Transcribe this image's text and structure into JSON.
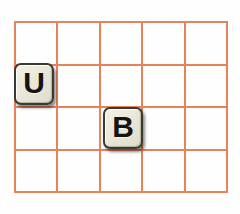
{
  "board": {
    "name": "letter-tile-grid",
    "columns": 5,
    "rows": 4,
    "cell_width": 43,
    "cell_height": 43,
    "grid_line_color": "#e8825a",
    "background_color": "#ffffff"
  },
  "tiles": [
    {
      "letter": "U",
      "row": 2,
      "column": 1,
      "face_color": "#e9e8d9",
      "border_color": "#3a3a34",
      "text_color": "#16140f"
    },
    {
      "letter": "B",
      "row": 3,
      "column": 3,
      "face_color": "#e9e8d9",
      "border_color": "#3a3a34",
      "text_color": "#16140f"
    }
  ]
}
